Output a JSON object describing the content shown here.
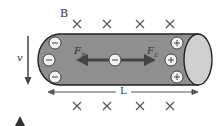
{
  "diagram": {
    "field_label": "B",
    "velocity_label": "v",
    "length_label": "L",
    "force_left": {
      "main": "F",
      "sub": "B"
    },
    "force_right": {
      "main": "F",
      "sub": "E"
    },
    "center_charge": "−",
    "left_charges": [
      "−",
      "−",
      "−"
    ],
    "right_charges": [
      "+",
      "+",
      "+"
    ],
    "field_symbol": "×",
    "colors": {
      "rod_body": "#8f8f8f",
      "rod_end": "#cfcfcf",
      "outline": "#222222",
      "arrow": "#444444",
      "charge_fill": "#f2f2f2"
    }
  }
}
